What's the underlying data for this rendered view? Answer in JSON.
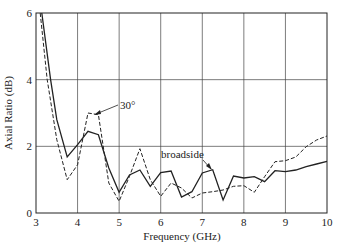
{
  "chart_data": {
    "type": "line",
    "title": "",
    "xlabel": "Frequency (GHz)",
    "ylabel": "Axial Ratio (dB)",
    "xlim": [
      3,
      10
    ],
    "ylim": [
      0,
      6
    ],
    "xticks": [
      3,
      4,
      5,
      6,
      7,
      8,
      9,
      10
    ],
    "yticks": [
      0,
      2,
      4,
      6
    ],
    "grid": true,
    "legend": "none (inline annotations)",
    "annotations": [
      {
        "text": "30°",
        "target_series": "30°"
      },
      {
        "text": "broadside",
        "target_series": "broadside"
      }
    ],
    "series": [
      {
        "name": "broadside",
        "style": "solid",
        "x": [
          3.14,
          3.35,
          3.5,
          3.75,
          4.0,
          4.25,
          4.5,
          4.75,
          5.0,
          5.25,
          5.5,
          5.75,
          6.0,
          6.25,
          6.5,
          6.75,
          7.0,
          7.25,
          7.5,
          7.75,
          8.0,
          8.25,
          8.5,
          8.75,
          9.0,
          9.25,
          9.5,
          9.75,
          10.0
        ],
        "y": [
          6.0,
          4.0,
          2.8,
          1.68,
          2.05,
          2.45,
          2.35,
          1.35,
          0.62,
          1.14,
          1.29,
          0.8,
          1.21,
          1.26,
          0.48,
          0.64,
          1.2,
          1.3,
          0.39,
          1.11,
          1.05,
          1.09,
          0.94,
          1.27,
          1.24,
          1.29,
          1.39,
          1.47,
          1.55
        ]
      },
      {
        "name": "30°",
        "style": "dashed",
        "x": [
          3.1,
          3.27,
          3.5,
          3.75,
          4.0,
          4.25,
          4.5,
          4.75,
          5.0,
          5.25,
          5.5,
          5.75,
          6.0,
          6.25,
          6.5,
          6.75,
          7.0,
          7.25,
          7.5,
          7.75,
          8.0,
          8.25,
          8.5,
          8.75,
          9.0,
          9.25,
          9.5,
          9.75,
          10.0
        ],
        "y": [
          6.0,
          4.0,
          2.2,
          1.0,
          1.45,
          3.0,
          2.95,
          0.9,
          0.35,
          1.1,
          1.93,
          1.0,
          0.5,
          0.9,
          0.75,
          0.45,
          0.6,
          0.64,
          0.69,
          0.8,
          0.82,
          0.62,
          1.09,
          1.54,
          1.57,
          1.68,
          1.99,
          2.19,
          2.31
        ]
      }
    ]
  },
  "labels": {
    "xlabel": "Frequency (GHz)",
    "ylabel": "Axial Ratio (dB)",
    "ann_30": "30°",
    "ann_broadside": "broadside"
  }
}
